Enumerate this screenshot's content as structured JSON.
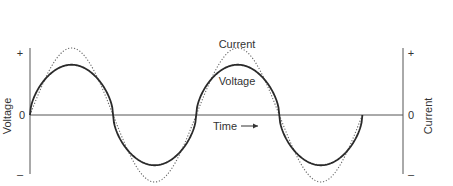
{
  "chart_data": {
    "type": "line",
    "title": "",
    "xlabel": "Time",
    "ylabel_left": "Voltage",
    "ylabel_right": "Current",
    "left_ticks": [
      "+",
      "0",
      "–"
    ],
    "right_ticks": [
      "+",
      "0",
      "–"
    ],
    "grid": false,
    "x_range": [
      0,
      2.0
    ],
    "x_unit": "periods",
    "series": [
      {
        "name": "Voltage",
        "style": "solid",
        "color": "#2a2a2a",
        "shape": "flattened sine (rounded square-ish)",
        "amplitude": 0.75,
        "x": [
          0,
          0.125,
          0.25,
          0.375,
          0.5,
          0.625,
          0.75,
          0.875,
          1.0,
          1.125,
          1.25,
          1.375,
          1.5,
          1.625,
          1.75,
          1.875,
          2.0
        ],
        "values": [
          0,
          0.68,
          0.75,
          0.68,
          0,
          -0.68,
          -0.75,
          -0.68,
          0,
          0.68,
          0.75,
          0.68,
          0,
          -0.68,
          -0.75,
          -0.68,
          0
        ]
      },
      {
        "name": "Current",
        "style": "dotted",
        "color": "#555555",
        "shape": "sine",
        "amplitude": 1.0,
        "x": [
          0,
          0.125,
          0.25,
          0.375,
          0.5,
          0.625,
          0.75,
          0.875,
          1.0,
          1.125,
          1.25,
          1.375,
          1.5,
          1.625,
          1.75,
          1.875,
          2.0
        ],
        "values": [
          0,
          0.71,
          1.0,
          0.71,
          0,
          -0.71,
          -1.0,
          -0.71,
          0,
          0.71,
          1.0,
          0.71,
          0,
          -0.71,
          -1.0,
          -0.71,
          0
        ]
      }
    ],
    "annotations": [
      {
        "text": "Current",
        "near": "peak of dotted curve, second cycle"
      },
      {
        "text": "Voltage",
        "near": "peak of solid curve, second cycle"
      },
      {
        "text": "Time →",
        "near": "below zero axis, center"
      }
    ]
  },
  "labels": {
    "left_axis": "Voltage",
    "right_axis": "Current",
    "time": "Time",
    "current_curve": "Current",
    "voltage_curve": "Voltage",
    "plus": "+",
    "zero": "0",
    "minus": "–"
  }
}
